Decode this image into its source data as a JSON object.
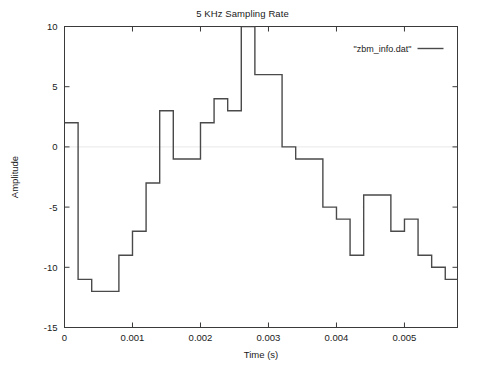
{
  "chart_data": {
    "type": "line",
    "title": "5 KHz Sampling Rate",
    "subtitle": "",
    "xlabel": "Time (s)",
    "ylabel": "Amplitude",
    "xlim": [
      0,
      0.00578
    ],
    "ylim": [
      -15,
      10
    ],
    "grid": false,
    "legend_position": "top-right",
    "legend": [
      "\"zbm_info.dat\""
    ],
    "xticks": [
      0,
      0.001,
      0.002,
      0.003,
      0.004,
      0.005
    ],
    "xtick_labels": [
      "0",
      "0.001",
      "0.002",
      "0.003",
      "0.004",
      "0.005"
    ],
    "yticks": [
      10,
      5,
      0,
      -5,
      -10,
      -15
    ],
    "ytick_labels": [
      "10",
      "5",
      "0",
      "-5",
      "-10",
      "-15"
    ],
    "sampling_rate_hz": 5000,
    "sample_interval_s": 0.0002,
    "series": [
      {
        "name": "\"zbm_info.dat\"",
        "style": "step",
        "color": "#4a4a4a",
        "x": [
          0.0,
          0.0002,
          0.0004,
          0.0006,
          0.0008,
          0.001,
          0.0012,
          0.0014,
          0.0016,
          0.0018,
          0.002,
          0.0022,
          0.0024,
          0.0026,
          0.0028,
          0.003,
          0.0032,
          0.0034,
          0.0036,
          0.0038,
          0.004,
          0.0042,
          0.0044,
          0.0046,
          0.0048,
          0.005,
          0.0052,
          0.0054,
          0.0056,
          0.0058
        ],
        "values": [
          2,
          -11,
          -12,
          -12,
          -9,
          -7,
          -3,
          3,
          -1,
          -1,
          2,
          4,
          3,
          10,
          6,
          6,
          0,
          -1,
          -1,
          -5,
          -6,
          -9,
          -4,
          -4,
          -7,
          -6,
          -9,
          -10,
          -11,
          -13
        ]
      }
    ]
  },
  "legend": {
    "entry_label": "\"zbm_info.dat\""
  },
  "axes": {
    "x_title": "Time (s)",
    "y_title": "Amplitude"
  }
}
